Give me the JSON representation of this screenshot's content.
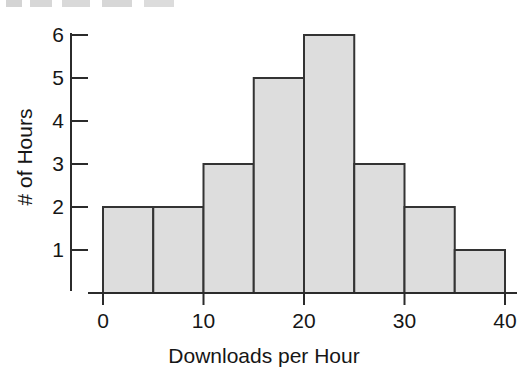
{
  "figure": {
    "background_color": "#ffffff",
    "ink_color": "#2b2b2b",
    "scan_artifact_present": true
  },
  "chart_data": {
    "type": "bar",
    "title": "",
    "subtitle": "",
    "xlabel": "Downloads per Hour",
    "ylabel": "# of Hours",
    "categories": [
      "0-5",
      "5-10",
      "10-15",
      "15-20",
      "20-25",
      "25-30",
      "30-35",
      "35-40"
    ],
    "bin_edges": [
      0,
      5,
      10,
      15,
      20,
      25,
      30,
      35,
      40
    ],
    "bin_width": 5,
    "values": [
      2,
      2,
      3,
      5,
      6,
      3,
      2,
      1
    ],
    "total_count": 24,
    "xlim": [
      0,
      40
    ],
    "ylim": [
      0,
      6
    ],
    "xticks": [
      0,
      10,
      20,
      30,
      40
    ],
    "xtick_labels": [
      "0",
      "10",
      "20",
      "30",
      "40"
    ],
    "yticks": [
      1,
      2,
      3,
      4,
      5,
      6
    ],
    "ytick_labels": [
      "1",
      "2",
      "3",
      "4",
      "5",
      "6"
    ],
    "grid": false,
    "legend": null,
    "legend_position": "none",
    "bar_fill_color": "#dddddd",
    "bar_edge_color": "#333333",
    "annotations": []
  }
}
